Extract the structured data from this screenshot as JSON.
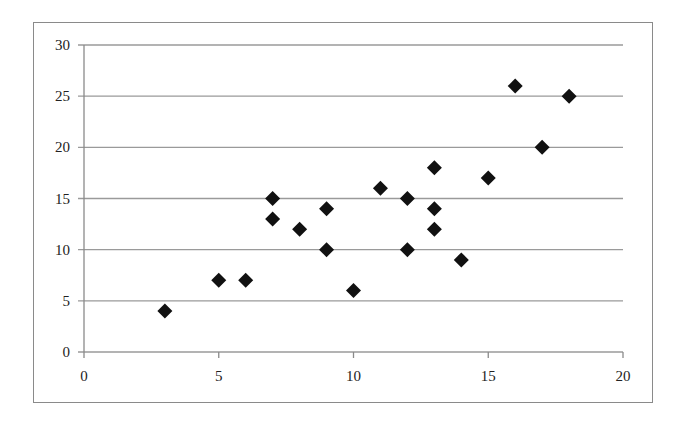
{
  "chart_data": {
    "type": "scatter",
    "title": "",
    "xlabel": "",
    "ylabel": "",
    "xlim": [
      0,
      20
    ],
    "ylim": [
      0,
      30
    ],
    "x_ticks": [
      0,
      5,
      10,
      15,
      20
    ],
    "y_ticks": [
      0,
      5,
      10,
      15,
      20,
      25,
      30
    ],
    "grid": {
      "horizontal": true,
      "vertical": false
    },
    "legend": null,
    "marker": "diamond",
    "marker_color": "#111111",
    "gridline_color": "#9a9a9a",
    "series": [
      {
        "name": "Series 1",
        "points": [
          {
            "x": 3,
            "y": 4
          },
          {
            "x": 5,
            "y": 7
          },
          {
            "x": 6,
            "y": 7
          },
          {
            "x": 7,
            "y": 15
          },
          {
            "x": 7,
            "y": 13
          },
          {
            "x": 8,
            "y": 12
          },
          {
            "x": 9,
            "y": 14
          },
          {
            "x": 9,
            "y": 10
          },
          {
            "x": 10,
            "y": 6
          },
          {
            "x": 11,
            "y": 16
          },
          {
            "x": 12,
            "y": 15
          },
          {
            "x": 12,
            "y": 10
          },
          {
            "x": 13,
            "y": 18
          },
          {
            "x": 13,
            "y": 14
          },
          {
            "x": 13,
            "y": 12
          },
          {
            "x": 14,
            "y": 9
          },
          {
            "x": 15,
            "y": 17
          },
          {
            "x": 16,
            "y": 26
          },
          {
            "x": 17,
            "y": 20
          },
          {
            "x": 18,
            "y": 25
          }
        ]
      }
    ]
  }
}
